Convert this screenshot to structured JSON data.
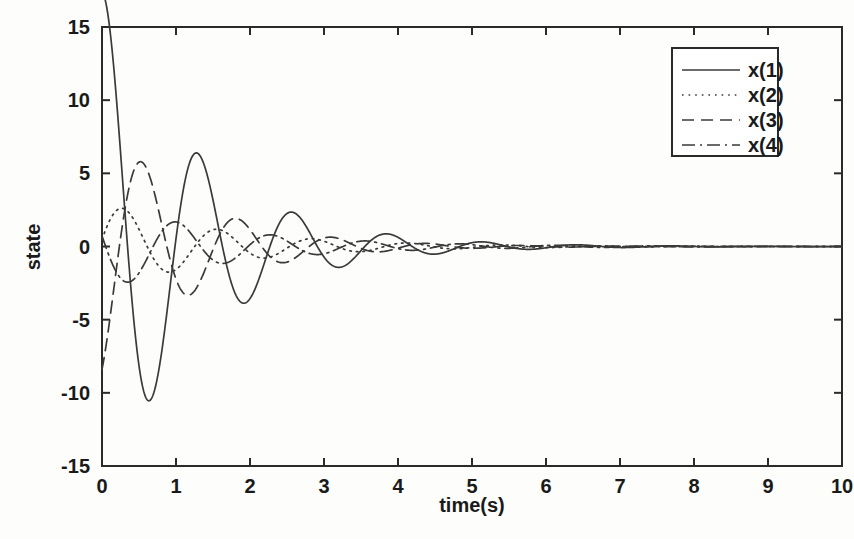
{
  "chart_data": {
    "type": "line",
    "title": "",
    "xlabel": "time(s)",
    "ylabel": "state",
    "xlim": [
      0,
      10
    ],
    "ylim": [
      -15,
      15
    ],
    "xticks": [
      "0",
      "1",
      "2",
      "3",
      "4",
      "5",
      "6",
      "7",
      "8",
      "9",
      "10"
    ],
    "yticks": [
      "15",
      "10",
      "5",
      "0",
      "-5",
      "-10",
      "-15"
    ],
    "grid": false,
    "legend_position": "top-right",
    "legend_entries": [
      {
        "label": "x(1)",
        "style": "solid"
      },
      {
        "label": "x(2)",
        "style": "dotted"
      },
      {
        "label": "x(3)",
        "style": "dashed"
      },
      {
        "label": "x(4)",
        "style": "dash-dot"
      }
    ],
    "series": [
      {
        "name": "x(1)",
        "style": "solid",
        "model": {
          "amplitude": 17.5,
          "decay": 0.78,
          "omega": 4.9,
          "phase": 1.45,
          "offset": 0
        }
      },
      {
        "name": "x(2)",
        "style": "dotted",
        "model": {
          "amplitude": 3.1,
          "decay": 0.62,
          "omega": 4.9,
          "phase": 0.15,
          "offset": 0
        }
      },
      {
        "name": "x(3)",
        "style": "dashed",
        "model": {
          "amplitude": 9.2,
          "decay": 0.86,
          "omega": 4.9,
          "phase": -1.15,
          "offset": 0
        }
      },
      {
        "name": "x(4)",
        "style": "dash-dot",
        "model": {
          "amplitude": 3.0,
          "decay": 0.58,
          "omega": 4.9,
          "phase": 2.9,
          "offset": 0
        }
      }
    ],
    "x": [
      0,
      0.1,
      0.2,
      0.3,
      0.4,
      0.5,
      0.6,
      0.7,
      0.8,
      0.9,
      1.0,
      1.1,
      1.2,
      1.3,
      1.4,
      1.5,
      1.6,
      1.7,
      1.8,
      1.9,
      2.0,
      2.1,
      2.2,
      2.3,
      2.4,
      2.5,
      2.6,
      2.7,
      2.8,
      2.9,
      3.0,
      3.2,
      3.4,
      3.6,
      3.8,
      4.0,
      4.2,
      4.4,
      4.6,
      4.8,
      5.0,
      5.2,
      5.4,
      5.6,
      5.8,
      6.0,
      6.4,
      6.8,
      7.2,
      7.6,
      8.0,
      8.5,
      9.0,
      9.5,
      10.0
    ],
    "values": {
      "x(1)": [
        2.0,
        -1.4,
        -6.2,
        -10.2,
        -12.1,
        -11.5,
        -8.1,
        -2.9,
        3.1,
        8.2,
        10.7,
        10.2,
        7.2,
        2.8,
        -1.9,
        -5.8,
        -8.0,
        -7.9,
        -5.6,
        -1.9,
        2.0,
        4.6,
        5.5,
        5.4,
        3.9,
        1.3,
        -1.4,
        -3.4,
        -4.1,
        -3.8,
        -2.6,
        0.4,
        2.4,
        2.7,
        1.8,
        0.1,
        -1.5,
        -2.1,
        -1.7,
        -0.6,
        0.6,
        1.3,
        1.2,
        0.6,
        -0.3,
        -0.9,
        -0.8,
        0.3,
        0.6,
        0.2,
        -0.4,
        -0.3,
        0.2,
        0.15,
        -0.1
      ],
      "x(2)": [
        0.0,
        -1.1,
        -1.9,
        -2.3,
        -2.2,
        -1.8,
        -1.2,
        -0.5,
        0.2,
        0.8,
        1.2,
        1.3,
        1.2,
        0.8,
        0.3,
        -0.2,
        -0.7,
        -1.0,
        -1.1,
        -1.0,
        -0.7,
        -0.3,
        0.1,
        0.4,
        0.6,
        0.7,
        0.6,
        0.4,
        0.1,
        -0.2,
        -0.4,
        -0.55,
        -0.3,
        0.1,
        0.35,
        0.4,
        0.2,
        -0.1,
        -0.3,
        -0.3,
        -0.1,
        0.1,
        0.25,
        0.2,
        0.0,
        -0.15,
        -0.2,
        0.05,
        0.15,
        0.05,
        -0.1,
        -0.05,
        0.05,
        0.05,
        -0.05
      ],
      "x(3)": [
        -8.5,
        -5.0,
        -0.9,
        2.7,
        4.6,
        4.9,
        3.5,
        1.1,
        -1.6,
        -3.8,
        -5.1,
        -5.0,
        -3.8,
        -1.8,
        0.4,
        2.2,
        2.9,
        2.6,
        1.6,
        0.2,
        -1.2,
        -2.1,
        -2.4,
        -2.2,
        -1.5,
        -0.4,
        0.5,
        1.2,
        1.4,
        1.2,
        0.7,
        -0.4,
        -1.1,
        -1.1,
        -0.6,
        0.1,
        0.6,
        0.8,
        0.6,
        0.2,
        -0.3,
        -0.6,
        -0.6,
        -0.3,
        0.1,
        0.4,
        0.4,
        -0.1,
        -0.3,
        -0.1,
        0.2,
        0.1,
        -0.1,
        -0.05,
        0.05
      ],
      "x(4)": [
        1.6,
        2.1,
        2.2,
        1.8,
        1.0,
        0.1,
        -0.8,
        -1.4,
        -1.7,
        -1.5,
        -1.0,
        -0.3,
        0.4,
        0.9,
        1.2,
        1.2,
        0.9,
        0.4,
        -0.1,
        -0.6,
        -0.9,
        -0.9,
        -0.7,
        -0.3,
        0.1,
        0.4,
        0.6,
        0.65,
        0.5,
        0.2,
        -0.1,
        -0.45,
        -0.35,
        0.05,
        0.35,
        0.4,
        0.2,
        -0.1,
        -0.3,
        -0.3,
        -0.1,
        0.1,
        0.25,
        0.22,
        0.05,
        -0.15,
        -0.2,
        0.05,
        0.18,
        0.08,
        -0.08,
        -0.06,
        0.06,
        0.05,
        -0.04
      ]
    }
  },
  "axes": {
    "x_label": "time(s)",
    "y_label": "state"
  }
}
